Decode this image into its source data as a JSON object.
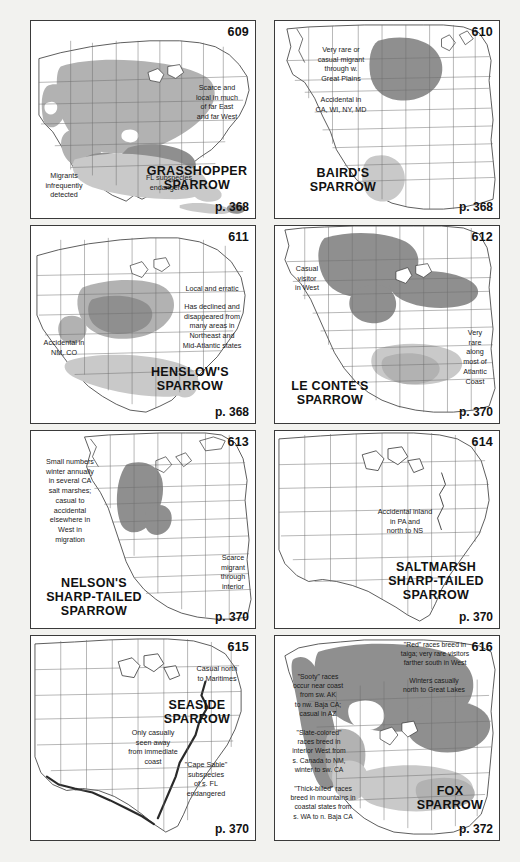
{
  "page": {
    "background_color": "#f2f2ef",
    "panel_background": "#ffffff",
    "border_color": "#3a3a3a",
    "shading": {
      "breeding_color": "#b2b2b2",
      "winter_color": "#c9c9c9",
      "year_round_color": "#8f8f8f",
      "migration_color": "#dcdcdc"
    }
  },
  "panels": [
    {
      "number": "609",
      "species": "GRASSHOPPER\nSPARROW",
      "page_ref": "p. 368",
      "notes": [
        "Scarce and\nlocal in much\nof far East\nand far West",
        "FL subspecies\nendangered",
        "Migrants\ninfrequently\ndetected"
      ]
    },
    {
      "number": "610",
      "species": "BAIRD'S\nSPARROW",
      "page_ref": "p. 368",
      "notes": [
        "Very rare or\ncasual migrant\nthrough w.\nGreat Plains",
        "Accidental in\nCA, WI, NY, MD"
      ]
    },
    {
      "number": "611",
      "species": "HENSLOW'S\nSPARROW",
      "page_ref": "p. 368",
      "notes": [
        "Local and erratic",
        "Has declined and\ndisappeared from\nmany areas in\nNortheast and\nMid-Atlantic states",
        "Accidental in\nNM, CO"
      ]
    },
    {
      "number": "612",
      "species": "LE CONTE'S\nSPARROW",
      "page_ref": "p. 370",
      "notes": [
        "Casual\nvisitor\nin West",
        "Very\nrare\nalong\nmost of\nAtlantic\nCoast"
      ]
    },
    {
      "number": "613",
      "species": "NELSON'S\nSHARP-TAILED\nSPARROW",
      "page_ref": "p. 370",
      "notes": [
        "Small numbers\nwinter annually\nin several CA\nsalt marshes;\ncasual to\naccidental\nelsewhere in\nWest in\nmigration",
        "Scarce\nmigrant\nthrough\ninterior"
      ]
    },
    {
      "number": "614",
      "species": "SALTMARSH\nSHARP-TAILED\nSPARROW",
      "page_ref": "p. 370",
      "notes": [
        "Accidental inland\nin PA and\nnorth to NS"
      ]
    },
    {
      "number": "615",
      "species": "SEASIDE\nSPARROW",
      "page_ref": "p. 370",
      "notes": [
        "Casual north\nto Maritimes",
        "Only casually\nseen away\nfrom immediate\ncoast",
        "\"Cape Sable\"\nsubspecies\nof s. FL\nendangered"
      ]
    },
    {
      "number": "616",
      "species": "FOX\nSPARROW",
      "page_ref": "p. 372",
      "notes": [
        "\"Red\" races breed in\ntaiga; very rare visitors\nfarther south in West",
        "Winters casually\nnorth to Great Lakes",
        "\"Sooty\" races\noccur near coast\nfrom sw. AK\nto nw. Baja CA;\ncasual in AZ",
        "\"Slate-colored\"\nraces breed in\ninterior West from\ns. Canada to NM,\nwinter to sw. CA",
        "\"Thick-billed\" races\nbreed in mountains in\ncoastal states from\ns. WA to n. Baja CA"
      ]
    }
  ]
}
